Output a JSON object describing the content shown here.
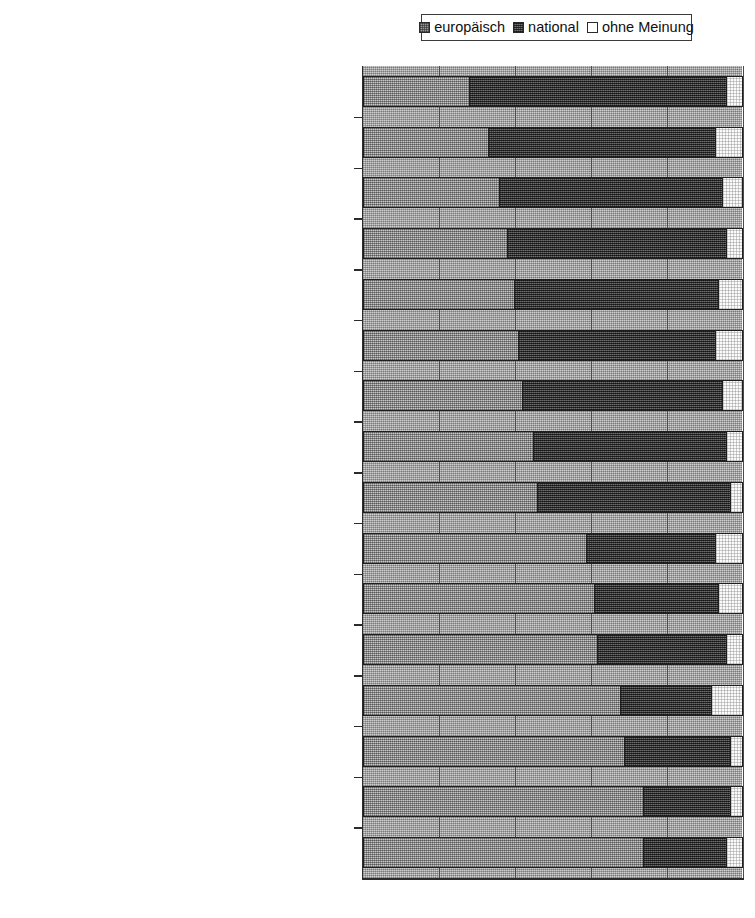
{
  "legend": {
    "position": "top-center",
    "entries": [
      {
        "label": "europäisch",
        "icon": "swatch-hatched-gray",
        "color": "#9c9c9c"
      },
      {
        "label": "national",
        "icon": "swatch-hatched-dark",
        "color": "#474747"
      },
      {
        "label": "ohne Meinung",
        "icon": "swatch-white",
        "color": "#ffffff"
      }
    ]
  },
  "axis": {
    "x_min": 0,
    "x_max": 100,
    "tick_step": 20,
    "tick_labels": [
      "0",
      "20",
      "40",
      "60",
      "80",
      "100"
    ],
    "grid": true
  },
  "chart_data": {
    "type": "bar",
    "orientation": "horizontal",
    "stacked": true,
    "stack_total": 100,
    "title": "",
    "xlabel": "",
    "ylabel": "",
    "xlim": [
      0,
      100
    ],
    "grid": true,
    "legend_position": "top-center",
    "categories": [
      "Soziale Sicherung",
      "Sozialpolitik",
      "Bildung und Ausbildung",
      "Beschäftigung und Kampf gegen die Arbeitslosigkeit",
      "Kultur",
      "Steuergesetzgebung",
      "Verbesserung der Lebensqualität der Bürger",
      "Gesundheit",
      "Innere Sicherheit",
      "Wirtschaft und Industrie",
      "Verteidigung und Truppenentsendung ins Ausland",
      "Einwanderung",
      "Außenpolitik",
      "Umwelt",
      "Nahrungsmittelsicherheit",
      "Forschung"
    ],
    "series": [
      {
        "name": "europäisch",
        "color": "#9c9c9c",
        "values": [
          28,
          33,
          36,
          38,
          40,
          41,
          42,
          45,
          46,
          59,
          61,
          62,
          68,
          69,
          74,
          74
        ]
      },
      {
        "name": "national",
        "color": "#474747",
        "values": [
          68,
          60,
          59,
          58,
          54,
          52,
          53,
          51,
          51,
          34,
          33,
          34,
          24,
          28,
          23,
          22
        ]
      },
      {
        "name": "ohne Meinung",
        "color": "#ffffff",
        "values": [
          4,
          7,
          5,
          4,
          6,
          7,
          5,
          4,
          3,
          7,
          6,
          4,
          8,
          3,
          3,
          4
        ]
      }
    ]
  }
}
